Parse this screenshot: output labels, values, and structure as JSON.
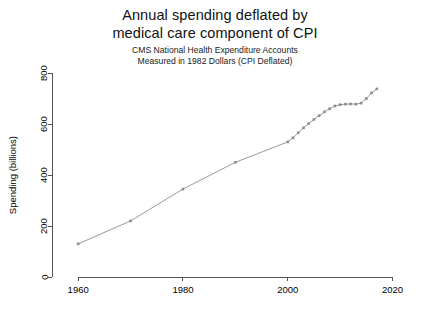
{
  "chart_data": {
    "type": "line",
    "title": "Annual spending deflated by medical care component of CPI",
    "title_lines": [
      "Annual spending deflated by",
      "medical care component of CPI"
    ],
    "subtitle_lines": [
      "CMS National Health Expenditure Accounts",
      "Measured in 1982 Dollars (CPI Deflated)"
    ],
    "xlabel": "",
    "ylabel": "Spending (billions)",
    "xlim": [
      1955,
      2022
    ],
    "ylim": [
      0,
      820
    ],
    "xticks": [
      1960,
      1980,
      2000,
      2020
    ],
    "yticks": [
      0,
      200,
      400,
      600,
      800
    ],
    "grid": false,
    "legend": "none",
    "marker": "filled-square",
    "series_color": "#8c8c8c",
    "line_color": "#9a9a9a",
    "axis_color": "#555555",
    "x": [
      1960,
      1970,
      1980,
      1990,
      2000,
      2001,
      2002,
      2003,
      2004,
      2005,
      2006,
      2007,
      2008,
      2009,
      2010,
      2011,
      2012,
      2013,
      2014,
      2015,
      2016,
      2017
    ],
    "values": [
      130,
      220,
      345,
      450,
      530,
      546,
      566,
      585,
      602,
      618,
      633,
      648,
      660,
      671,
      676,
      678,
      679,
      678,
      682,
      700,
      722,
      738
    ],
    "annotations": []
  },
  "figure": {
    "background": "#ffffff",
    "canvas_width": 430,
    "canvas_height": 312
  }
}
